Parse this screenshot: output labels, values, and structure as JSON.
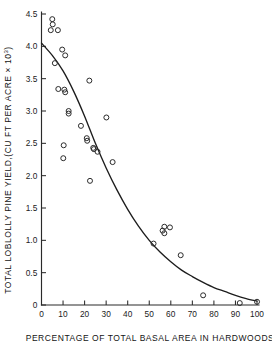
{
  "chart_data": {
    "type": "scatter",
    "title": "",
    "xlabel": "PERCENTAGE OF TOTAL BASAL AREA IN HARDWOODS",
    "ylabel_main": "TOTAL LOBLOLLY PINE YIELD,(CU FT PER ACRE × 10",
    "ylabel_sup": "3",
    "ylabel_tail": ")",
    "ylabel_full": "TOTAL LOBLOLLY PINE YIELD,(CU FT PER ACRE × 10³)",
    "xlim": [
      0,
      100
    ],
    "ylim": [
      0,
      4.5
    ],
    "xticks": [
      0,
      10,
      20,
      30,
      40,
      50,
      60,
      70,
      80,
      90,
      100
    ],
    "xtick_labels": [
      "0",
      "10",
      "20",
      "30",
      "40",
      "50",
      "60",
      "70",
      "80",
      "90",
      "100"
    ],
    "yticks": [
      0,
      0.5,
      1.0,
      1.5,
      2.0,
      2.5,
      3.0,
      3.5,
      4.0,
      4.5
    ],
    "ytick_labels": [
      "0",
      "0.5",
      "1.0",
      "1.5",
      "2.0",
      "2.5",
      "3.0",
      "3.5",
      "4.0",
      "4.5"
    ],
    "grid": false,
    "legend": null,
    "marker": "open-circle",
    "marker_color": "#2b2b2b",
    "curve_color": "#1d1d1d",
    "axis_color": "#2a2a2a",
    "background": "#ffffff",
    "points": [
      [
        5.0,
        4.42
      ],
      [
        5.2,
        4.34
      ],
      [
        4.3,
        4.25
      ],
      [
        7.6,
        4.25
      ],
      [
        9.6,
        3.95
      ],
      [
        11.0,
        3.86
      ],
      [
        6.2,
        3.74
      ],
      [
        22.2,
        3.47
      ],
      [
        7.8,
        3.34
      ],
      [
        10.6,
        3.33
      ],
      [
        11.0,
        3.29
      ],
      [
        12.6,
        3.0
      ],
      [
        12.6,
        2.96
      ],
      [
        30.1,
        2.9
      ],
      [
        18.3,
        2.77
      ],
      [
        21.0,
        2.58
      ],
      [
        21.2,
        2.54
      ],
      [
        10.3,
        2.47
      ],
      [
        24.0,
        2.43
      ],
      [
        24.3,
        2.41
      ],
      [
        26.0,
        2.37
      ],
      [
        10.1,
        2.27
      ],
      [
        33.0,
        2.21
      ],
      [
        22.5,
        1.92
      ],
      [
        57.0,
        1.21
      ],
      [
        59.6,
        1.2
      ],
      [
        56.2,
        1.15
      ],
      [
        57.0,
        1.11
      ],
      [
        52.0,
        0.95
      ],
      [
        64.6,
        0.77
      ],
      [
        75.0,
        0.15
      ],
      [
        92.0,
        0.03
      ],
      [
        100.0,
        0.05
      ]
    ],
    "fit_curve": {
      "description": "smooth monotonic decay curve fitted through the scatter",
      "points": [
        [
          0.0,
          4.05
        ],
        [
          5.0,
          3.86
        ],
        [
          10.0,
          3.62
        ],
        [
          15.0,
          3.3
        ],
        [
          20.0,
          2.92
        ],
        [
          25.0,
          2.5
        ],
        [
          30.0,
          2.12
        ],
        [
          35.0,
          1.78
        ],
        [
          40.0,
          1.48
        ],
        [
          45.0,
          1.22
        ],
        [
          50.0,
          1.0
        ],
        [
          55.0,
          0.82
        ],
        [
          60.0,
          0.67
        ],
        [
          65.0,
          0.54
        ],
        [
          70.0,
          0.44
        ],
        [
          75.0,
          0.35
        ],
        [
          80.0,
          0.27
        ],
        [
          85.0,
          0.21
        ],
        [
          90.0,
          0.15
        ],
        [
          95.0,
          0.1
        ],
        [
          100.0,
          0.06
        ]
      ]
    }
  }
}
